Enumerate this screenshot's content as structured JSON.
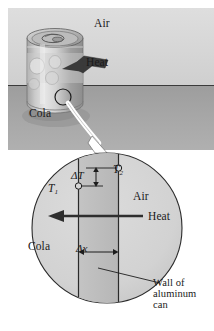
{
  "figure": {
    "scene": {
      "background_sky": "#d9d9d9",
      "background_ground": "#a8a8a8",
      "horizon_y": 85
    },
    "top_labels": {
      "air": "Air",
      "heat": "Heat",
      "cola": "Cola"
    },
    "detail_labels": {
      "t2": "T",
      "t2_sub": "2",
      "delta_t": "ΔT",
      "t1": "T",
      "t1_sub": "1",
      "air": "Air",
      "heat": "Heat",
      "cola": "Cola",
      "delta_x": "Δx",
      "wall_line1": "Wall of",
      "wall_line2": "aluminum",
      "wall_line3": "can"
    },
    "colors": {
      "line": "#1a1a1a",
      "detail_circle_fill": "#cfcfcf",
      "wall_fill": "#bdbdbd",
      "can_body": "#c8c8c8",
      "arrow_white": "#ffffff",
      "arrow_dark": "#3a3a3a"
    },
    "icon_names": {
      "magnifier": "magnifier-circle-icon",
      "callout": "callout-arrow-icon",
      "heat_arrow_top": "heat-arrow-icon",
      "heat_arrow_detail": "heat-flow-arrow-icon",
      "delta_t_arrow": "delta-t-dimension-icon",
      "delta_x_arrow": "delta-x-dimension-icon",
      "leader": "leader-line-icon",
      "can": "cola-can-icon"
    }
  }
}
